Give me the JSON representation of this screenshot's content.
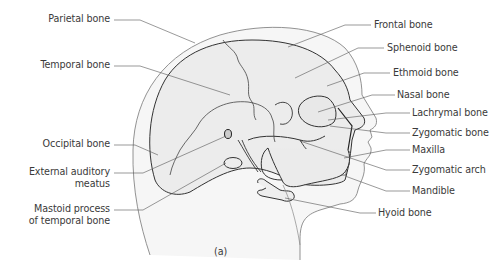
{
  "figure": {
    "caption": "(a)",
    "colors": {
      "bone_fill": "#ececec",
      "skin_fill": "#f6f6f6",
      "outline": "#333333",
      "leader_line": "#555555",
      "text": "#3a3a3a",
      "background": "#ffffff"
    }
  },
  "labels_left": [
    {
      "id": "parietal",
      "lines": [
        "Parietal bone"
      ]
    },
    {
      "id": "temporal",
      "lines": [
        "Temporal bone"
      ]
    },
    {
      "id": "occipital",
      "lines": [
        "Occipital bone"
      ]
    },
    {
      "id": "external-auditory-meatus",
      "lines": [
        "External auditory",
        "meatus"
      ]
    },
    {
      "id": "mastoid-process",
      "lines": [
        "Mastoid process",
        "of temporal bone"
      ]
    }
  ],
  "labels_right": [
    {
      "id": "frontal",
      "lines": [
        "Frontal bone"
      ]
    },
    {
      "id": "sphenoid",
      "lines": [
        "Sphenoid bone"
      ]
    },
    {
      "id": "ethmoid",
      "lines": [
        "Ethmoid bone"
      ]
    },
    {
      "id": "nasal",
      "lines": [
        "Nasal bone"
      ]
    },
    {
      "id": "lachrymal",
      "lines": [
        "Lachrymal bone"
      ]
    },
    {
      "id": "zygomatic-bone",
      "lines": [
        "Zygomatic bone"
      ]
    },
    {
      "id": "maxilla",
      "lines": [
        "Maxilla"
      ]
    },
    {
      "id": "zygomatic-arch",
      "lines": [
        "Zygomatic arch"
      ]
    },
    {
      "id": "mandible",
      "lines": [
        "Mandible"
      ]
    },
    {
      "id": "hyoid",
      "lines": [
        "Hyoid bone"
      ]
    }
  ]
}
